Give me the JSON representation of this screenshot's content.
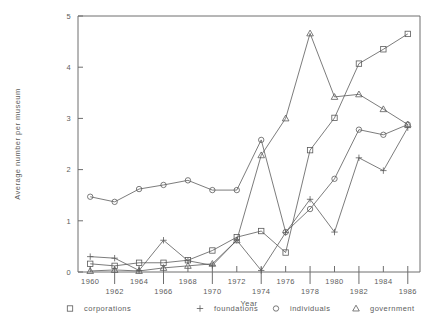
{
  "chart_data": {
    "type": "line",
    "title": "",
    "xlabel": "Year",
    "ylabel": "Average number per museum",
    "xlim": [
      1959,
      1987
    ],
    "ylim": [
      0,
      5
    ],
    "grid": false,
    "legend_position": "bottom",
    "x": [
      1960,
      1962,
      1964,
      1966,
      1968,
      1970,
      1972,
      1974,
      1976,
      1978,
      1980,
      1982,
      1984,
      1986
    ],
    "xticks": [
      1960,
      1962,
      1964,
      1966,
      1968,
      1970,
      1972,
      1974,
      1976,
      1978,
      1980,
      1982,
      1984,
      1986
    ],
    "yticks": [
      0,
      1,
      2,
      3,
      4,
      5
    ],
    "series": [
      {
        "name": "corporations",
        "marker": "square",
        "values": [
          0.16,
          0.12,
          0.18,
          0.18,
          0.23,
          0.42,
          0.68,
          0.8,
          0.38,
          2.38,
          3.01,
          4.07,
          4.35,
          4.65
        ]
      },
      {
        "name": "foundations",
        "marker": "plus",
        "values": [
          0.3,
          0.27,
          0.03,
          0.62,
          0.22,
          0.13,
          0.62,
          0.03,
          0.77,
          1.42,
          0.78,
          2.23,
          1.98,
          2.82
        ]
      },
      {
        "name": "individuals",
        "marker": "circle",
        "values": [
          1.47,
          1.37,
          1.62,
          1.7,
          1.79,
          1.6,
          1.6,
          2.58,
          0.78,
          1.23,
          1.82,
          2.78,
          2.68,
          2.88
        ]
      },
      {
        "name": "government",
        "marker": "triangle",
        "values": [
          0.02,
          0.04,
          0.02,
          0.08,
          0.12,
          0.16,
          0.62,
          2.28,
          3.0,
          4.66,
          3.42,
          3.47,
          3.18,
          2.88
        ]
      }
    ]
  },
  "legend": {
    "items": [
      {
        "label": "corporations",
        "marker": "square"
      },
      {
        "label": "foundations",
        "marker": "plus"
      },
      {
        "label": "individuals",
        "marker": "circle"
      },
      {
        "label": "government",
        "marker": "triangle"
      }
    ]
  }
}
